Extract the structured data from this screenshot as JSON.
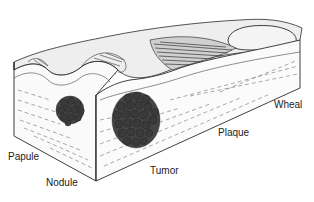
{
  "figure": {
    "labels": {
      "papule": "Papule",
      "nodule": "Nodule",
      "tumor": "Tumor",
      "plaque": "Plaque",
      "wheal": "Wheal"
    },
    "colors": {
      "background": "#ffffff",
      "line": "#2a2a2a",
      "surface": "#ececec",
      "cluster": "#3a3a3a",
      "text": "#222222"
    }
  }
}
